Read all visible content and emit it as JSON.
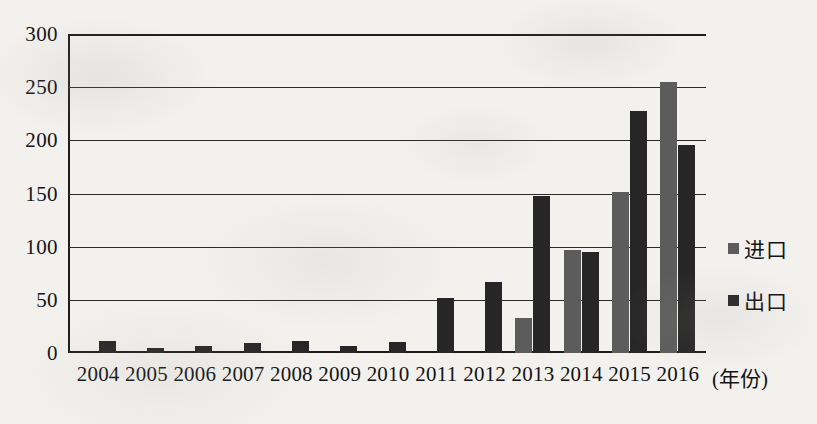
{
  "chart_data": {
    "type": "bar",
    "title": "",
    "subtitle": "",
    "xlabel": "(年份)",
    "ylabel": "",
    "ylim": [
      0,
      300
    ],
    "ytick_values": [
      300,
      250,
      200,
      150,
      100,
      50,
      0
    ],
    "ytick_labels": [
      "300",
      "250",
      "200",
      "150",
      "100",
      "50",
      "0"
    ],
    "grid": true,
    "legend_position": "right",
    "categories": [
      "2004",
      "2005",
      "2006",
      "2007",
      "2008",
      "2009",
      "2010",
      "2011",
      "2012",
      "2013",
      "2014",
      "2015",
      "2016"
    ],
    "series": [
      {
        "name": "进口",
        "color": "#5c5c5c",
        "values": [
          0,
          0,
          0,
          0,
          0,
          0,
          0,
          0,
          0,
          33,
          97,
          151,
          255
        ]
      },
      {
        "name": "出口",
        "color": "#262626",
        "values": [
          11,
          5,
          7,
          9,
          11,
          7,
          10,
          52,
          67,
          148,
          95,
          228,
          196
        ]
      }
    ]
  },
  "legend": {
    "items": [
      {
        "label": "进口",
        "color": "#5c5c5c",
        "swatch_name": "legend-swatch-import"
      },
      {
        "label": "出口",
        "color": "#262626",
        "swatch_name": "legend-swatch-export"
      }
    ]
  },
  "colors": {
    "background": "#f2f1ee",
    "axis": "#1d1d1d",
    "grid": "#2a2a2a",
    "text": "#141414",
    "import_bar": "#5c5c5c",
    "export_bar": "#262626"
  }
}
